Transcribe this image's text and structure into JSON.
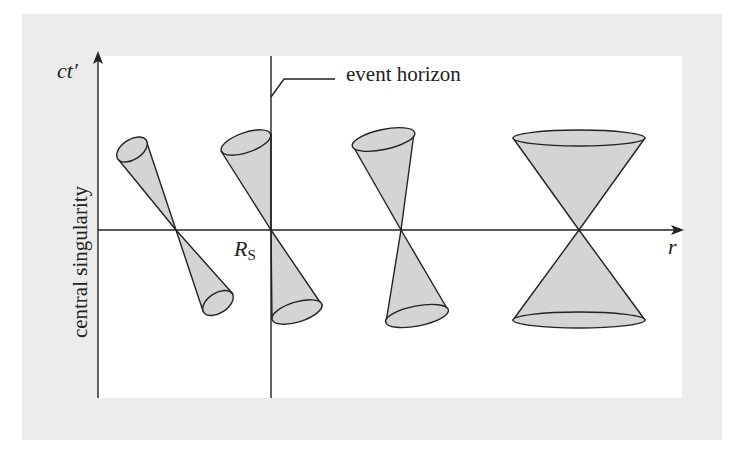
{
  "diagram": {
    "colors": {
      "outer_background": "#ffffff",
      "frame_background": "#ececec",
      "plot_background": "#ffffff",
      "cone_fill": "#d4d4d4",
      "stroke": "#222222"
    },
    "axes": {
      "y_label": "ct′",
      "x_label": "r",
      "left_axis_label": "central singularity"
    },
    "markers": {
      "horizon_label": "event horizon",
      "rs_label": "R",
      "rs_subscript": "S"
    },
    "light_cones": [
      {
        "id": "cone-1",
        "position": "inside horizon, far left",
        "tilt": "strong tilt toward singularity"
      },
      {
        "id": "cone-2",
        "position": "at event horizon R_S",
        "tilt": "one edge vertical along horizon"
      },
      {
        "id": "cone-3",
        "position": "outside horizon",
        "tilt": "slight tilt"
      },
      {
        "id": "cone-4",
        "position": "far from black hole",
        "tilt": "upright, symmetric"
      }
    ]
  }
}
